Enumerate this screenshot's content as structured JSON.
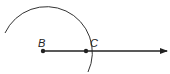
{
  "diagram": {
    "type": "geometric-construction",
    "points": [
      {
        "id": "B",
        "label": "B",
        "x": 43,
        "y": 51
      },
      {
        "id": "C",
        "label": "C",
        "x": 86,
        "y": 51
      }
    ],
    "ray": {
      "from": "B",
      "through": "C",
      "end_x": 168,
      "end_y": 51
    },
    "arc": {
      "center": "B",
      "radius": 43,
      "passes_through": "C"
    },
    "colors": {
      "stroke": "#222222",
      "background": "#ffffff"
    }
  }
}
